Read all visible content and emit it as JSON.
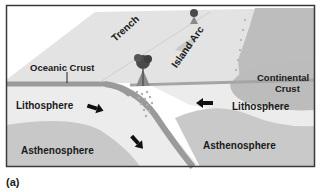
{
  "figure": {
    "caption": "(a)",
    "labels": {
      "trench": "Trench",
      "island_arc": "Island Arc",
      "oceanic_crust": "Oceanic Crust",
      "continental_crust_line1": "Continental",
      "continental_crust_line2": "Crust",
      "lithosphere_left": "Lithosphere",
      "lithosphere_right": "Lithosphere",
      "asthenosphere_left": "Asthenosphere",
      "asthenosphere_right": "Asthenosphere"
    },
    "icons": [
      "volcano-icon",
      "small-volcano-icon",
      "arrow-right-down-icon",
      "arrow-down-right-icon",
      "arrow-left-icon",
      "magma-droplets-icon"
    ],
    "colors": {
      "surface": "#e4e4e4",
      "surface_dark": "#cfcfcf",
      "continent": "#b8b8b8",
      "lithosphere": "#ececec",
      "asthenosphere": "#c9c9c9",
      "slab": "#9a9a9a",
      "frame": "#3a3a3a",
      "arrow": "#111111"
    }
  }
}
